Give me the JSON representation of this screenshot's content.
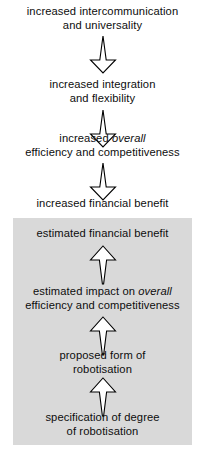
{
  "diagram": {
    "type": "vertical-flowchart",
    "title": "",
    "shaded_region_color": "#d9d9d9",
    "background_color": "#ffffff",
    "stroke_color": "#000000",
    "nodes": [
      {
        "id": "increased-intercommunication",
        "line1": "increased intercommunication",
        "line2": "and universality",
        "region": "upper"
      },
      {
        "id": "increased-integration",
        "line1": "increased integration",
        "line2": "and flexibility",
        "region": "upper"
      },
      {
        "id": "increased-overall-efficiency",
        "line1_pre": "increased ",
        "line1_em": "overall",
        "line2": "efficiency and competitiveness",
        "region": "upper"
      },
      {
        "id": "increased-financial-benefit",
        "line1": "increased financial benefit",
        "line2": "",
        "region": "upper"
      },
      {
        "id": "estimated-financial-benefit",
        "line1": "estimated financial benefit",
        "line2": "",
        "region": "shaded"
      },
      {
        "id": "estimated-impact-overall-efficiency",
        "line1_pre": "estimated impact on ",
        "line1_em": "overall",
        "line2": "efficiency and competitiveness",
        "region": "shaded"
      },
      {
        "id": "proposed-form-of-robotisation",
        "line1": "proposed form of",
        "line2": "robotisation",
        "region": "shaded"
      },
      {
        "id": "specification-of-degree-of-robotisation",
        "line1": "specification of degree",
        "line2": "of robotisation",
        "region": "shaded"
      }
    ],
    "connectors": [
      {
        "id": "connector-1",
        "direction": "down",
        "from": "increased-intercommunication",
        "to": "increased-integration"
      },
      {
        "id": "connector-2",
        "direction": "down",
        "from": "increased-integration",
        "to": "increased-overall-efficiency"
      },
      {
        "id": "connector-3",
        "direction": "down",
        "from": "increased-overall-efficiency",
        "to": "increased-financial-benefit"
      },
      {
        "id": "connector-4",
        "direction": "up",
        "from": "estimated-impact-overall-efficiency",
        "to": "estimated-financial-benefit"
      },
      {
        "id": "connector-5",
        "direction": "up",
        "from": "proposed-form-of-robotisation",
        "to": "estimated-impact-overall-efficiency"
      },
      {
        "id": "connector-6",
        "direction": "up",
        "from": "specification-of-degree-of-robotisation",
        "to": "proposed-form-of-robotisation"
      }
    ]
  }
}
